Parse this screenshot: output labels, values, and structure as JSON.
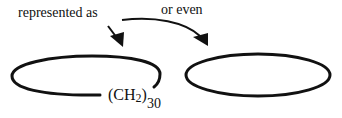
{
  "diagram": {
    "labels": {
      "represented_as": "represented as",
      "or_even": "or even"
    },
    "formula": {
      "open_paren": "(",
      "element": "CH",
      "atom_subscript": "2",
      "close_paren": ")",
      "repeat_subscript": "30"
    },
    "shapes": [
      {
        "name": "open-ring",
        "type": "ellipse-open",
        "note": "open loop with (CH2)30 label"
      },
      {
        "name": "closed-ring",
        "type": "ellipse-closed"
      }
    ],
    "arrows": [
      {
        "name": "arrow-represented-as",
        "from": "represented as",
        "to": "open-ring"
      },
      {
        "name": "arrow-or-even",
        "from": "or even",
        "to": "closed-ring",
        "style": "curved"
      }
    ],
    "colors": {
      "stroke": "#111111",
      "background": "#ffffff"
    }
  }
}
